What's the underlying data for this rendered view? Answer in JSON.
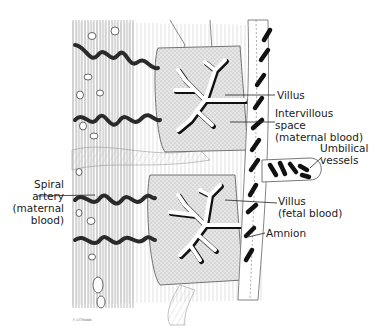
{
  "figure": {
    "labels": {
      "villus": "Villus",
      "intervillous_line1": "Intervillous",
      "intervillous_line2": "space",
      "intervillous_line3": "(maternal blood)",
      "umbilical_line1": "Umbilical",
      "umbilical_line2": "vessels",
      "spiral_line1": "Spiral",
      "spiral_line2": "artery",
      "spiral_line3": "(maternal",
      "spiral_line4": "blood)",
      "villus_fetal_line1": "Villus",
      "villus_fetal_line2": "(fetal blood)",
      "amnion": "Amnion"
    },
    "credit": "F. LITTMANN"
  }
}
